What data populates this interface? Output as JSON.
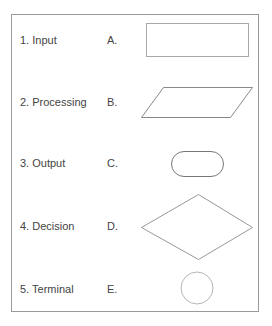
{
  "rows": [
    {
      "label": "1. Input",
      "letter": "A.",
      "shape": "rectangle",
      "y": 40
    },
    {
      "label": "2. Processing",
      "letter": "B.",
      "shape": "parallelogram",
      "y": 102
    },
    {
      "label": "3. Output",
      "letter": "C.",
      "shape": "rounded-rectangle",
      "y": 163
    },
    {
      "label": "4. Decision",
      "letter": "D.",
      "shape": "diamond",
      "y": 226
    },
    {
      "label": "5. Terminal",
      "letter": "E.",
      "shape": "circle",
      "y": 289
    }
  ],
  "colors": {
    "frame_border": "#9a9a9a",
    "text": "#444444",
    "shape_stroke_dark": "#888888",
    "shape_stroke_light": "#b0b0b0"
  }
}
